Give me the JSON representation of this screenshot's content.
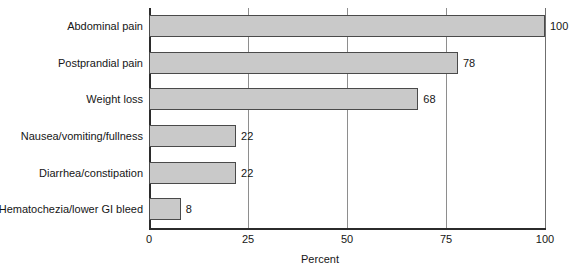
{
  "chart_data": {
    "type": "bar",
    "orientation": "horizontal",
    "title": "",
    "xlabel": "Percent",
    "ylabel": "",
    "categories": [
      "Abdominal pain",
      "Postprandial pain",
      "Weight loss",
      "Nausea/vomiting/fullness",
      "Diarrhea/constipation",
      "Hematochezia/lower GI bleed"
    ],
    "values": [
      100,
      78,
      68,
      22,
      22,
      8
    ],
    "value_labels": [
      "100",
      "78",
      "68",
      "22",
      "22",
      "8"
    ],
    "xlim": [
      0,
      100
    ],
    "xticks": [
      0,
      25,
      50,
      75,
      100
    ],
    "xtick_labels": [
      "0",
      "25",
      "50",
      "75",
      "100"
    ],
    "grid": true,
    "grid_axis": "x",
    "legend": false,
    "bar_fill_color": "#c9c9c9",
    "bar_edge_color": "#4a4a4a",
    "axis_color": "#2b2b2b",
    "gridline_color": "#8e8e8e"
  }
}
